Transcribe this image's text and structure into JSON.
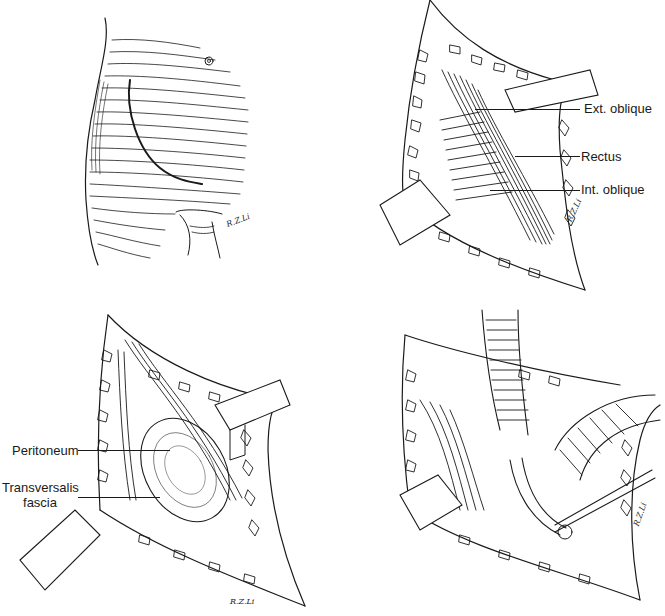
{
  "figure": {
    "panels": [
      {
        "id": "A",
        "description": "Lower abdomen with curved oblique skin incision line",
        "signature": "R.Z. Li"
      },
      {
        "id": "B",
        "description": "Incision opened with retractors exposing abdominal wall muscles",
        "signature": "R.Z. Li",
        "labels": [
          "Ext. oblique",
          "Rectus",
          "Int. oblique"
        ]
      },
      {
        "id": "C",
        "description": "Deeper dissection exposing peritoneum and transversalis fascia",
        "signature": "R.Z. Li",
        "labels": [
          "Peritoneum",
          "Transversalis",
          "fascia"
        ]
      },
      {
        "id": "D",
        "description": "Retracted structures with deep exposure and instrument",
        "signature": "R.Z. Li"
      }
    ]
  },
  "labels": {
    "ext_oblique": "Ext. oblique",
    "rectus": "Rectus",
    "int_oblique": "Int. oblique",
    "peritoneum": "Peritoneum",
    "transversalis_line1": "Transversalis",
    "transversalis_line2": "fascia"
  },
  "signatures": {
    "a": "R.Z.Li",
    "b": "R.Z.Li",
    "c": "R.Z.Li",
    "d": "R.Z.Li"
  },
  "colors": {
    "ink": "#1a1a1a",
    "paper": "#ffffff"
  }
}
